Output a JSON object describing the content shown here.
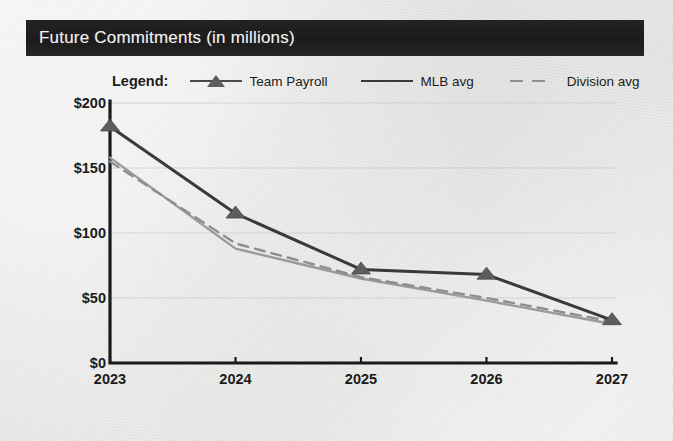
{
  "header": {
    "title": "Future Commitments (in millions)"
  },
  "legend": {
    "label": "Legend:",
    "items": [
      {
        "name": "Team Payroll",
        "style": "line-with-triangle-marker",
        "color": "#3a3a3a"
      },
      {
        "name": "MLB avg",
        "style": "solid-line",
        "color": "#3a3a3a"
      },
      {
        "name": "Division avg",
        "style": "dashed-line",
        "color": "#8e8e8e"
      }
    ]
  },
  "chart_data": {
    "type": "line",
    "title": "Future Commitments (in millions)",
    "xlabel": "",
    "ylabel": "",
    "categories": [
      "2023",
      "2024",
      "2025",
      "2026",
      "2027"
    ],
    "x": [
      2023,
      2024,
      2025,
      2026,
      2027
    ],
    "series": [
      {
        "name": "Team Payroll",
        "values": [
          182,
          115,
          72,
          68,
          33
        ],
        "marker": "triangle",
        "color": "#3a3a3a",
        "dash": false
      },
      {
        "name": "MLB avg",
        "values": [
          158,
          88,
          65,
          48,
          30
        ],
        "marker": "none",
        "color": "#9a9a9a",
        "dash": false
      },
      {
        "name": "Division avg",
        "values": [
          155,
          92,
          66,
          50,
          32
        ],
        "marker": "none",
        "color": "#8e8e8e",
        "dash": true
      }
    ],
    "ylim": [
      0,
      200
    ],
    "yticks": [
      0,
      50,
      100,
      150,
      200
    ],
    "ytick_labels": [
      "$0",
      "$50",
      "$100",
      "$150",
      "$200"
    ],
    "xtick_labels": [
      "2023",
      "2024",
      "2025",
      "2026",
      "2027"
    ],
    "grid": true,
    "grid_axis": "y",
    "legend_position": "top"
  },
  "colors": {
    "title_bar_bg": "#1f1f1f",
    "title_bar_text": "#f2f2f0",
    "paper_bg": "#e8e8e6",
    "axis": "#1a1a1a",
    "gridline": "#cfcfcd"
  }
}
